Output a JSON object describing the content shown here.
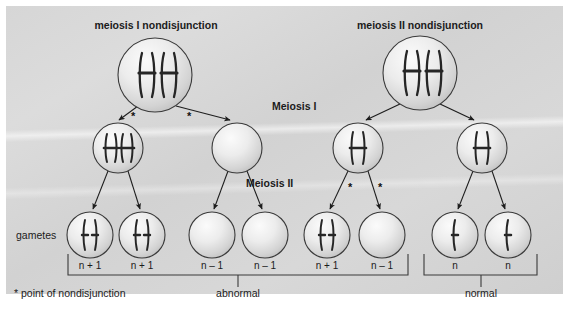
{
  "diagram": {
    "titles": {
      "left": "meiosis I nondisjunction",
      "right": "meiosis II nondisjunction"
    },
    "stages": {
      "meiosis_one": "Meiosis I",
      "meiosis_two": "Meiosis II"
    },
    "row_label": "gametes",
    "footnote": "* point of nondisjunction",
    "star_marker": "*",
    "group_labels": {
      "abnormal": "abnormal",
      "normal": "normal"
    },
    "gamete_counts": [
      "n + 1",
      "n + 1",
      "n – 1",
      "n – 1",
      "n + 1",
      "n – 1",
      "n",
      "n"
    ],
    "colors": {
      "panel_background": "#d6d6d6",
      "cell_fill_light": "#f2f2f2",
      "cell_fill_dark": "#c4c4c4",
      "cell_stroke": "#3a3a3a",
      "chromosome": "#2b2b2b",
      "text": "#1b1b1b",
      "bracket": "#3a3a3a"
    },
    "cells": [
      {
        "name": "parent-cell-meiosis-I",
        "x": 155,
        "y": 75,
        "r": 37,
        "chromosomes": "two-duplicated"
      },
      {
        "name": "parent-cell-meiosis-II",
        "x": 420,
        "y": 73,
        "r": 37,
        "chromosomes": "two-duplicated"
      },
      {
        "name": "daughter-cell-left-1",
        "x": 118,
        "y": 148,
        "r": 25,
        "chromosomes": "two-duplicated-small"
      },
      {
        "name": "daughter-cell-left-2",
        "x": 237,
        "y": 148,
        "r": 25,
        "chromosomes": "none"
      },
      {
        "name": "daughter-cell-right-1",
        "x": 358,
        "y": 148,
        "r": 25,
        "chromosomes": "one-duplicated-small"
      },
      {
        "name": "daughter-cell-right-2",
        "x": 482,
        "y": 148,
        "r": 25,
        "chromosomes": "one-duplicated-small"
      },
      {
        "name": "gamete-cell-1",
        "x": 90,
        "y": 235,
        "r": 23,
        "chromosomes": "two-single"
      },
      {
        "name": "gamete-cell-2",
        "x": 142,
        "y": 235,
        "r": 23,
        "chromosomes": "two-single"
      },
      {
        "name": "gamete-cell-3",
        "x": 212,
        "y": 235,
        "r": 23,
        "chromosomes": "none"
      },
      {
        "name": "gamete-cell-4",
        "x": 265,
        "y": 235,
        "r": 23,
        "chromosomes": "none"
      },
      {
        "name": "gamete-cell-5",
        "x": 327,
        "y": 235,
        "r": 23,
        "chromosomes": "two-single"
      },
      {
        "name": "gamete-cell-6",
        "x": 382,
        "y": 235,
        "r": 23,
        "chromosomes": "none"
      },
      {
        "name": "gamete-cell-7",
        "x": 455,
        "y": 235,
        "r": 23,
        "chromosomes": "one-single"
      },
      {
        "name": "gamete-cell-8",
        "x": 508,
        "y": 235,
        "r": 23,
        "chromosomes": "one-single"
      }
    ]
  }
}
